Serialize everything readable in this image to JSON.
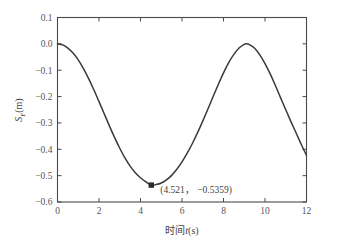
{
  "chart_data": {
    "type": "line",
    "title": "",
    "subtitle": "",
    "xlabel": "时间t(s)",
    "xlabel_cjk": "时间",
    "xlabel_var": "t",
    "xlabel_unit": "(s)",
    "ylabel": "S_F(m)",
    "ylabel_var": "S",
    "ylabel_sub": "F",
    "ylabel_unit": "(m)",
    "xlim": [
      0,
      12
    ],
    "ylim": [
      -0.6,
      0.1
    ],
    "xticks": [
      0,
      2,
      4,
      6,
      8,
      10,
      12
    ],
    "xtick_labels": [
      "0",
      "2",
      "4",
      "6",
      "8",
      "10",
      "12"
    ],
    "yticks": [
      0.1,
      0.0,
      -0.1,
      -0.2,
      -0.3,
      -0.4,
      -0.5,
      -0.6
    ],
    "ytick_labels": [
      "0.1",
      "0.0",
      "−0.1",
      "−0.2",
      "−0.3",
      "−0.4",
      "−0.5",
      "−0.6"
    ],
    "grid": false,
    "legend": null,
    "tick_direction": "in",
    "frame": "box",
    "line_color": "#3a3a3a",
    "axis_color": "#4a4a4a",
    "series": [
      {
        "name": "S_F",
        "x": [
          0.0,
          0.25,
          0.5,
          0.75,
          1.0,
          1.25,
          1.5,
          1.75,
          2.0,
          2.25,
          2.5,
          2.75,
          3.0,
          3.25,
          3.5,
          3.75,
          4.0,
          4.25,
          4.521,
          4.75,
          5.0,
          5.25,
          5.5,
          5.75,
          6.0,
          6.25,
          6.5,
          6.75,
          7.0,
          7.25,
          7.5,
          7.75,
          8.0,
          8.25,
          8.5,
          8.75,
          9.0,
          9.1,
          9.25,
          9.5,
          9.75,
          10.0,
          10.25,
          10.5,
          10.75,
          11.0,
          11.25,
          11.5,
          11.75,
          12.0
        ],
        "y": [
          0.0,
          -0.004,
          -0.016,
          -0.035,
          -0.061,
          -0.094,
          -0.132,
          -0.174,
          -0.219,
          -0.265,
          -0.311,
          -0.355,
          -0.396,
          -0.433,
          -0.464,
          -0.489,
          -0.508,
          -0.523,
          -0.5359,
          -0.534,
          -0.528,
          -0.516,
          -0.499,
          -0.476,
          -0.448,
          -0.415,
          -0.378,
          -0.337,
          -0.293,
          -0.247,
          -0.2,
          -0.154,
          -0.11,
          -0.071,
          -0.04,
          -0.016,
          -0.002,
          0.0,
          -0.003,
          -0.017,
          -0.042,
          -0.075,
          -0.114,
          -0.158,
          -0.204,
          -0.25,
          -0.295,
          -0.338,
          -0.382,
          -0.423
        ]
      }
    ],
    "annotations": [
      {
        "text": "(4.521， −0.5359)",
        "point_x": 4.521,
        "point_y": -0.5359,
        "marker": "square",
        "marker_color": "#2b2b2b"
      }
    ]
  }
}
